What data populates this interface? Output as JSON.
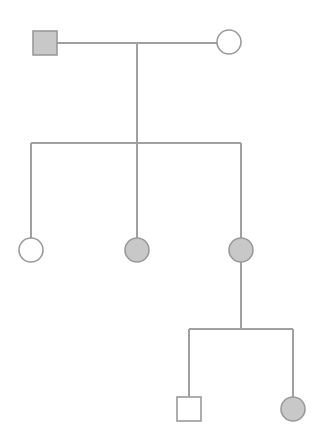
{
  "diagram": {
    "type": "pedigree",
    "width": 322,
    "height": 448,
    "colors": {
      "background": "#ffffff",
      "line": "#a0a0a0",
      "stroke": "#9a9a9a",
      "affected_fill": "#c8c8c8",
      "unaffected_fill": "#ffffff"
    },
    "nodes": [
      {
        "id": "gen1-father",
        "sex": "male",
        "affected": true,
        "generation": 1,
        "cx": 45,
        "cy": 43
      },
      {
        "id": "gen1-mother",
        "sex": "female",
        "affected": false,
        "generation": 1,
        "cx": 229,
        "cy": 42
      },
      {
        "id": "gen2-daughter-1",
        "sex": "female",
        "affected": false,
        "generation": 2,
        "cx": 31,
        "cy": 250
      },
      {
        "id": "gen2-daughter-2",
        "sex": "female",
        "affected": true,
        "generation": 2,
        "cx": 137,
        "cy": 250
      },
      {
        "id": "gen2-daughter-3",
        "sex": "female",
        "affected": true,
        "generation": 2,
        "cx": 241,
        "cy": 250
      },
      {
        "id": "gen3-son",
        "sex": "male",
        "affected": false,
        "generation": 3,
        "cx": 189,
        "cy": 409
      },
      {
        "id": "gen3-daughter",
        "sex": "female",
        "affected": true,
        "generation": 3,
        "cx": 293,
        "cy": 409
      }
    ],
    "lines": [
      {
        "id": "mating-line",
        "x1": 57,
        "y1": 43,
        "x2": 217,
        "y2": 43
      },
      {
        "id": "descent-line-gen1",
        "x1": 137,
        "y1": 43,
        "x2": 137,
        "y2": 143
      },
      {
        "id": "sibship-line-gen2",
        "x1": 31,
        "y1": 143,
        "x2": 241,
        "y2": 143
      },
      {
        "id": "child-line-gen2-1",
        "x1": 31,
        "y1": 143,
        "x2": 31,
        "y2": 238
      },
      {
        "id": "child-line-gen2-2",
        "x1": 137,
        "y1": 143,
        "x2": 137,
        "y2": 238
      },
      {
        "id": "child-line-gen2-3",
        "x1": 241,
        "y1": 143,
        "x2": 241,
        "y2": 238
      },
      {
        "id": "descent-line-gen2",
        "x1": 241,
        "y1": 262,
        "x2": 241,
        "y2": 329
      },
      {
        "id": "sibship-line-gen3",
        "x1": 189,
        "y1": 329,
        "x2": 293,
        "y2": 329
      },
      {
        "id": "child-line-gen3-1",
        "x1": 189,
        "y1": 329,
        "x2": 189,
        "y2": 397
      },
      {
        "id": "child-line-gen3-2",
        "x1": 293,
        "y1": 329,
        "x2": 293,
        "y2": 397
      }
    ],
    "symbol_size": 24,
    "legend": {
      "square": "male",
      "circle": "female",
      "shaded": "affected",
      "unshaded": "unaffected"
    }
  }
}
